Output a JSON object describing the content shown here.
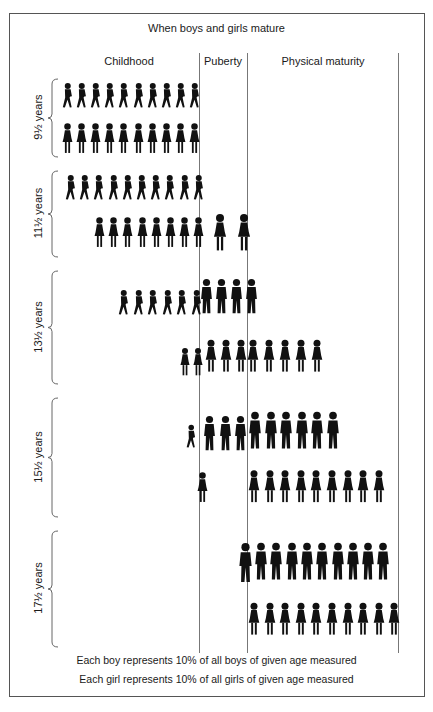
{
  "title": "When boys and girls mature",
  "columns": [
    {
      "label": "Childhood"
    },
    {
      "label": "Puberty"
    },
    {
      "label": "Physical maturity"
    }
  ],
  "ages": [
    {
      "label": "9½ years"
    },
    {
      "label": "11½ years"
    },
    {
      "label": "13½ years"
    },
    {
      "label": "15½ years"
    },
    {
      "label": "17½ years"
    }
  ],
  "footer": {
    "boy_note": "Each boy represents 10% of all boys of given age measured",
    "girl_note": "Each girl represents 10% of all girls of given age measured"
  },
  "icons": {
    "boy": "boy-silhouette-icon",
    "girl": "girl-silhouette-icon",
    "brace": "curly-brace-icon"
  },
  "colors": {
    "figure": "#111111",
    "lines": "#777777",
    "frame": "#555555"
  },
  "chart_data": {
    "type": "table",
    "title": "When boys and girls mature",
    "unit": "percent of children of given age (each figure = 10%)",
    "categories": [
      "Childhood",
      "Puberty",
      "Physical maturity"
    ],
    "rows": [
      {
        "age": "9½ years",
        "sex": "boys",
        "values": [
          100,
          0,
          0
        ]
      },
      {
        "age": "9½ years",
        "sex": "girls",
        "values": [
          100,
          0,
          0
        ]
      },
      {
        "age": "11½ years",
        "sex": "boys",
        "values": [
          100,
          0,
          0
        ]
      },
      {
        "age": "11½ years",
        "sex": "girls",
        "values": [
          80,
          20,
          0
        ]
      },
      {
        "age": "13½ years",
        "sex": "boys",
        "values": [
          60,
          40,
          0
        ]
      },
      {
        "age": "13½ years",
        "sex": "girls",
        "values": [
          20,
          30,
          50
        ]
      },
      {
        "age": "15½ years",
        "sex": "boys",
        "values": [
          10,
          30,
          60
        ]
      },
      {
        "age": "15½ years",
        "sex": "girls",
        "values": [
          0,
          10,
          90
        ]
      },
      {
        "age": "17½ years",
        "sex": "boys",
        "values": [
          0,
          10,
          90
        ]
      },
      {
        "age": "17½ years",
        "sex": "girls",
        "values": [
          0,
          0,
          100
        ]
      }
    ],
    "legend": [
      "Each boy represents 10% of all boys of given age measured",
      "Each girl represents 10% of all girls of given age measured"
    ]
  }
}
